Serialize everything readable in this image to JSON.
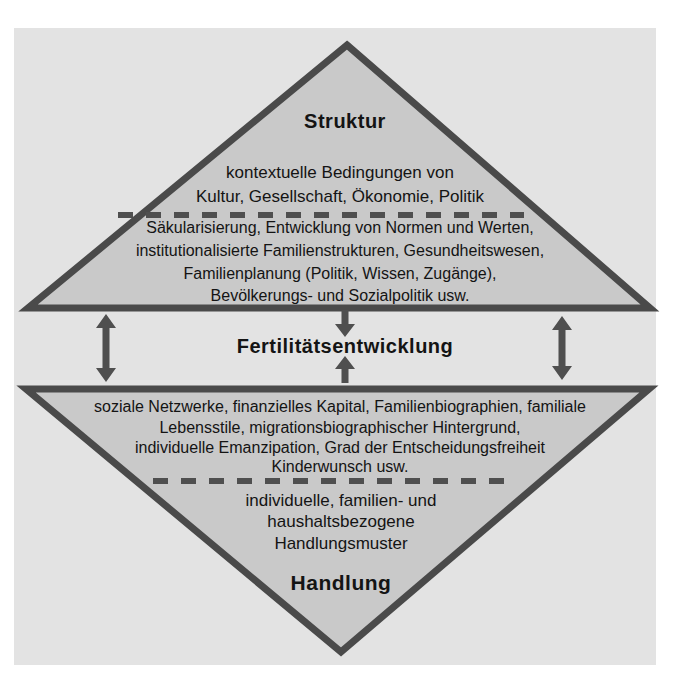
{
  "colors": {
    "page_bg": "#ffffff",
    "panel_bg": "#e3e3e3",
    "triangle_fill": "#c9c9c9",
    "triangle_border": "#4a4a4a",
    "arrow": "#4f4f4f",
    "dash": "#4f4f4f",
    "text": "#141414"
  },
  "top_triangle": {
    "heading": "Struktur",
    "context_lines": [
      "kontextuelle Bedingungen von",
      "Kultur, Gesellschaft, Ökonomie, Politik"
    ],
    "detail_lines": [
      "Säkularisierung, Entwicklung von Normen und Werten,",
      "institutionalisierte Familienstrukturen, Gesundheitswesen,",
      "Familienplanung (Politik, Wissen, Zugänge),",
      "Bevölkerungs- und Sozialpolitik usw."
    ]
  },
  "center": {
    "label": "Fertilitätsentwicklung"
  },
  "bottom_triangle": {
    "heading": "Handlung",
    "detail_lines": [
      "soziale Netzwerke, finanzielles Kapital, Familienbiographien, familiale",
      "Lebensstile, migrationsbiographischer Hintergrund,",
      "individuelle Emanzipation, Grad der Entscheidungsfreiheit",
      "Kinderwunsch usw."
    ],
    "context_lines": [
      "individuelle, familien- und",
      "haushaltsbezogene",
      "Handlungsmuster"
    ]
  },
  "icons": {
    "left_arrow": "double-vertical-arrow",
    "right_arrow": "double-vertical-arrow",
    "center_top_arrow": "arrow-down",
    "center_bottom_arrow": "arrow-up"
  }
}
